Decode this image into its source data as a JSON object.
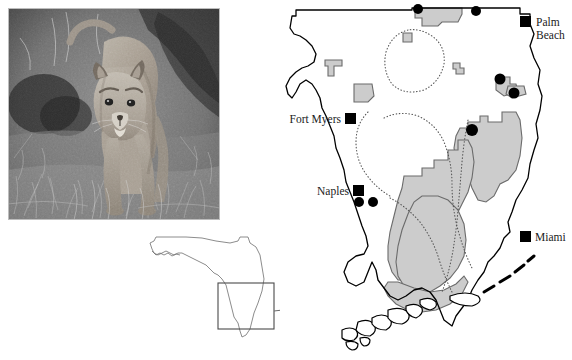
{
  "figure": {
    "panels": [
      {
        "name": "panther-photo",
        "caption": "Florida panther standing in grass (black and white photograph)"
      },
      {
        "name": "south-florida-map",
        "caption": "Map of South Florida showing protected areas and panther locations"
      },
      {
        "name": "florida-inset",
        "caption": "State of Florida outline with study-area box"
      }
    ]
  },
  "photo": {
    "subject": "Florida panther",
    "style": "black-and-white photograph",
    "alt": "A panther standing on grassy ground facing the camera"
  },
  "map": {
    "region": "South Florida",
    "cities": [
      {
        "id": "palm-beach",
        "label_line1": "Palm",
        "label_line2": "Beach",
        "label": "Palm Beach",
        "marker": "square"
      },
      {
        "id": "fort-myers",
        "label": "Fort Myers",
        "marker": "square"
      },
      {
        "id": "naples",
        "label": "Naples",
        "marker": "square"
      },
      {
        "id": "miami",
        "label": "Miami",
        "marker": "square"
      }
    ],
    "legend_symbols": {
      "city_marker": "black-square",
      "record_marker": "black-circle",
      "protected_area_fill": "#cccccc",
      "boundary_style": "dotted"
    },
    "colors": {
      "land_outline": "#000000",
      "protected_area": "#cccccc",
      "protected_outline": "#6b6b6b",
      "dotted_boundary": "#555555",
      "marker": "#000000",
      "background": "#ffffff"
    },
    "features": {
      "protected_areas_count": 9,
      "record_dots_count": 7,
      "keys_islands": "Florida Keys island chain"
    }
  },
  "inset": {
    "label": "Florida",
    "box_caption": "study area",
    "outline_color": "#6e6e6e",
    "box_color": "#4a4a4a",
    "arrow_color": "#6a6a6a"
  }
}
